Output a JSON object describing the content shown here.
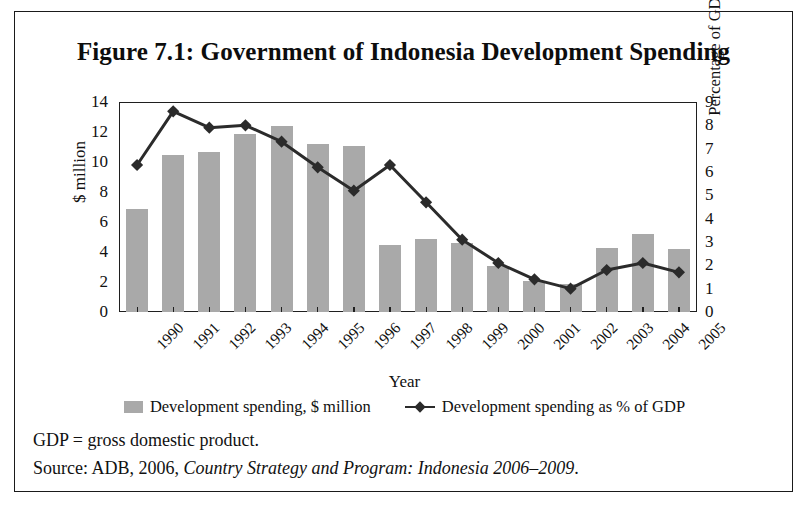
{
  "figure": {
    "title": "Figure 7.1: Government of Indonesia Development Spending",
    "notes_line1": "GDP = gross domestic product.",
    "source_prefix": "Source: ADB, 2006, ",
    "source_italic": "Country Strategy and Program: Indonesia 2006–2009",
    "source_suffix": "."
  },
  "legend": {
    "bar_label": "Development spending, $ million",
    "line_label": "Development spending as % of GDP"
  },
  "colors": {
    "bar_fill": "#a9a9a9",
    "line_color": "#2b2b2b",
    "axis": "#1f1f1f",
    "border": "#1a1a1a",
    "background": "#ffffff"
  },
  "chart_data": {
    "type": "bar",
    "title": "Figure 7.1: Government of Indonesia Development Spending",
    "xlabel": "Year",
    "ylabel": "$ million",
    "y2label": "Percentage of GDP",
    "categories": [
      "1990",
      "1991",
      "1992",
      "1993",
      "1994",
      "1995",
      "1996",
      "1997",
      "1998",
      "1999",
      "2000",
      "2001",
      "2002",
      "2003",
      "2004",
      "2005"
    ],
    "ylim": [
      0,
      14
    ],
    "y2lim": [
      0,
      9
    ],
    "yticks": [
      0,
      2,
      4,
      6,
      8,
      10,
      12,
      14
    ],
    "y2ticks": [
      0,
      1,
      2,
      3,
      4,
      5,
      6,
      7,
      8,
      9
    ],
    "grid": false,
    "legend_position": "bottom",
    "series": [
      {
        "name": "Development spending, $ million",
        "type": "bar",
        "axis": "left",
        "values": [
          6.9,
          10.5,
          10.7,
          11.9,
          12.4,
          11.2,
          11.1,
          4.5,
          4.9,
          4.6,
          3.1,
          2.1,
          1.9,
          4.3,
          5.2,
          4.2
        ]
      },
      {
        "name": "Development spending as % of GDP",
        "type": "line",
        "axis": "right",
        "values": [
          6.3,
          8.6,
          7.9,
          8.0,
          7.3,
          6.2,
          5.2,
          6.3,
          4.7,
          3.1,
          2.1,
          1.4,
          1.0,
          1.8,
          2.1,
          1.7
        ]
      }
    ]
  }
}
